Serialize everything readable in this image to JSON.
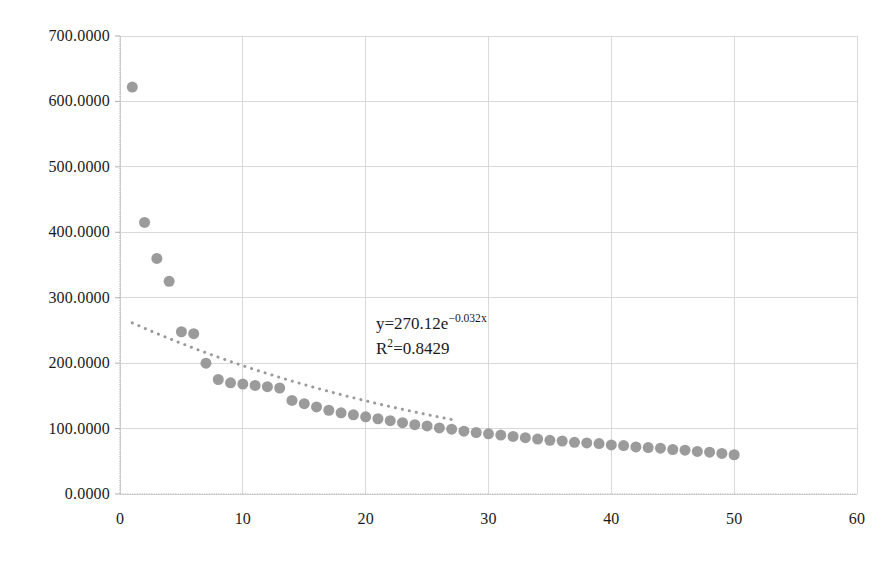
{
  "chart_data": {
    "type": "scatter",
    "title": "",
    "xlabel": "",
    "ylabel": "",
    "xlim": [
      0,
      60
    ],
    "ylim": [
      0,
      700
    ],
    "grid": true,
    "legend": "none",
    "x_ticks": [
      "0",
      "10",
      "20",
      "30",
      "40",
      "50",
      "60"
    ],
    "x_tick_values": [
      0,
      10,
      20,
      30,
      40,
      50,
      60
    ],
    "y_ticks": [
      "0.0000",
      "100.0000",
      "200.0000",
      "300.0000",
      "400.0000",
      "500.0000",
      "600.0000",
      "700.0000"
    ],
    "y_tick_values": [
      0,
      100,
      200,
      300,
      400,
      500,
      600,
      700
    ],
    "marker_color": "#969696",
    "marker_size": 11,
    "trendline_color": "#9a9a9a",
    "trendline_style": "dotted",
    "gridline_color": "#d9d9d9",
    "axis_color": "#b0b0b0",
    "annotation": {
      "equation_prefix": "y=270.12e",
      "equation_exponent": "−0.032x",
      "r_squared_prefix": "R",
      "r_squared_sup": "2",
      "r_squared_value": "=0.8429",
      "full_equation": "y=270.12e^(−0.032x)",
      "full_r_squared": "R²=0.8429",
      "coefficient": 270.12,
      "exponent_rate": -0.032,
      "r_squared": 0.8429
    },
    "series": [
      {
        "name": "observed",
        "x": [
          1,
          2,
          3,
          4,
          5,
          6,
          7,
          8,
          9,
          10,
          11,
          12,
          13,
          14,
          15,
          16,
          17,
          18,
          19,
          20,
          21,
          22,
          23,
          24,
          25,
          26,
          27,
          28,
          29,
          30,
          31,
          32,
          33,
          34,
          35,
          36,
          37,
          38,
          39,
          40,
          41,
          42,
          43,
          44,
          45,
          46,
          47,
          48,
          49,
          50
        ],
        "values": [
          622,
          415,
          360,
          325,
          248,
          245,
          200,
          175,
          170,
          168,
          166,
          164,
          162,
          143,
          138,
          133,
          128,
          124,
          121,
          118,
          115,
          112,
          109,
          106,
          104,
          101,
          99,
          96,
          94,
          92,
          90,
          88,
          86,
          84,
          82,
          81,
          79,
          78,
          77,
          75,
          74,
          72,
          71,
          70,
          68,
          67,
          65,
          64,
          62,
          60
        ]
      },
      {
        "name": "exponential-trendline",
        "x_start": 1,
        "x_end": 27,
        "y_start": 262,
        "y_end": 114
      }
    ]
  }
}
